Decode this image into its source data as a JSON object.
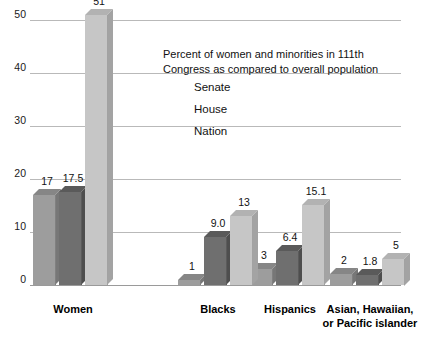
{
  "chart_data": {
    "type": "bar",
    "title": "Percent of women and minorities in  111th Congress as compared to overall population",
    "title_line1": "Percent of women and minorities in  111th",
    "title_line2": "Congress as compared to overall population",
    "xlabel": "",
    "ylabel": "",
    "ylim": [
      0,
      50
    ],
    "yticks": [
      0,
      10,
      20,
      30,
      40,
      50
    ],
    "ytick_labels": [
      "0",
      "10",
      "20",
      "30",
      "40",
      "50"
    ],
    "grid": true,
    "legend_position": "upper-center-right",
    "categories": [
      "Women",
      "Blacks",
      "Hispanics",
      "Asian, Hawaiian, or Pacific islander"
    ],
    "category_labels": [
      {
        "line1": "Women",
        "line2": ""
      },
      {
        "line1": "Blacks",
        "line2": ""
      },
      {
        "line1": "Hispanics",
        "line2": ""
      },
      {
        "line1": "Asian, Hawaiian,",
        "line2": "or Pacific islander"
      }
    ],
    "series": [
      {
        "name": "Senate",
        "color": "#9d9d9d",
        "values": [
          17,
          1,
          3,
          2
        ],
        "data_labels": [
          "17",
          "1",
          "3",
          "2"
        ]
      },
      {
        "name": "House",
        "color": "#6f6f6f",
        "values": [
          17.5,
          9.0,
          6.4,
          1.8
        ],
        "data_labels": [
          "17.5",
          "9.0",
          "6.4",
          "1.8"
        ]
      },
      {
        "name": "Nation",
        "color": "#c6c6c6",
        "values": [
          51,
          13,
          15.1,
          5
        ],
        "data_labels": [
          "51",
          "13",
          "15.1",
          "5"
        ]
      }
    ]
  },
  "colors": {
    "background": "#ffffff",
    "gridline": "#b9b9b9",
    "baseline": "#9a9a9a",
    "text": "#111111"
  }
}
